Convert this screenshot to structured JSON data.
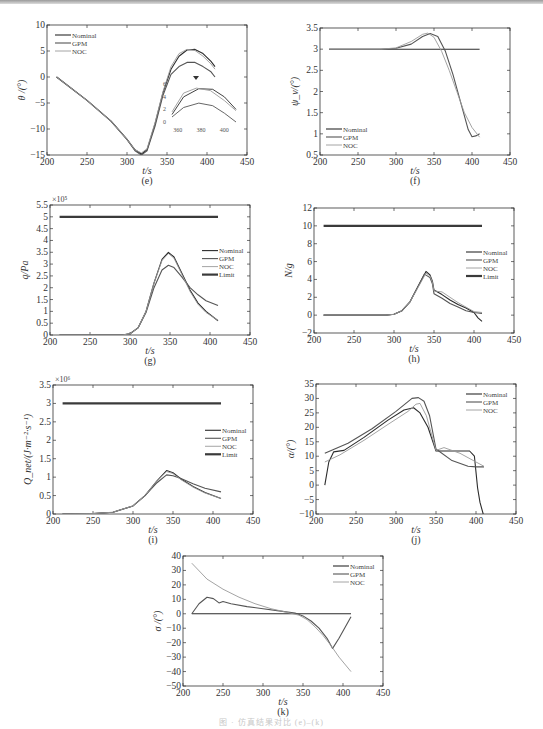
{
  "caption": "图 · 仿真结果对比 (e)–(k)",
  "colors": {
    "Nominal": "#2b2b2b",
    "GPM": "#555555",
    "NOC": "#9a9a9a",
    "Limit": "#3a3a3a"
  },
  "chart_data": [
    {
      "id": "e",
      "type": "line",
      "panel_label": "(e)",
      "xlabel": "t/s",
      "ylabel": "θ /(°)",
      "xlim": [
        200,
        450
      ],
      "ylim": [
        -15,
        10
      ],
      "xticks": [
        200,
        250,
        300,
        350,
        400,
        450
      ],
      "yticks": [
        -15,
        -10,
        -5,
        0,
        5,
        10
      ],
      "box": [
        47,
        25,
        247,
        155
      ],
      "legend": [
        "Nominal",
        "GPM",
        "NOC"
      ],
      "legend_pos": "upper-left",
      "series": [
        {
          "name": "Nominal",
          "x": [
            212,
            250,
            280,
            300,
            310,
            318,
            325,
            335,
            345,
            355,
            365,
            375,
            385,
            395,
            405,
            410
          ],
          "y": [
            0,
            -4.5,
            -8.5,
            -12,
            -14,
            -14.8,
            -14,
            -9,
            -3,
            1.5,
            4,
            5.2,
            5.3,
            4.5,
            3,
            2
          ]
        },
        {
          "name": "GPM",
          "x": [
            212,
            250,
            280,
            300,
            310,
            318,
            325,
            335,
            345,
            355,
            365,
            375,
            385,
            395,
            405,
            410
          ],
          "y": [
            0,
            -4.5,
            -8.5,
            -12,
            -14.2,
            -15,
            -14.2,
            -9.5,
            -3.5,
            0.5,
            2,
            2.8,
            2.8,
            2,
            1,
            0
          ]
        },
        {
          "name": "NOC",
          "x": [
            212,
            250,
            280,
            300,
            310,
            318,
            325,
            335,
            345,
            355,
            365,
            375,
            385,
            395,
            405,
            410
          ],
          "y": [
            0,
            -4.5,
            -8.5,
            -12,
            -14,
            -14.6,
            -13.8,
            -8.8,
            -2.8,
            2,
            4.5,
            5.3,
            5.1,
            4,
            2.5,
            1.5
          ]
        }
      ],
      "inset": {
        "xticks": [
          360,
          380,
          400
        ],
        "yticks": [
          0,
          2,
          4,
          6
        ],
        "note": "zoom of 355–410 s region"
      }
    },
    {
      "id": "f",
      "type": "line",
      "panel_label": "(f)",
      "xlabel": "t/s",
      "ylabel": "ψ_v/(°)",
      "xlim": [
        200,
        450
      ],
      "ylim": [
        0.5,
        3.5
      ],
      "xticks": [
        200,
        250,
        300,
        350,
        400,
        450
      ],
      "yticks": [
        0.5,
        1,
        1.5,
        2,
        2.5,
        3,
        3.5
      ],
      "box": [
        320,
        28,
        510,
        155
      ],
      "legend": [
        "Nominal",
        "GPM",
        "NOC"
      ],
      "legend_pos": "lower-left",
      "series": [
        {
          "name": "Nominal",
          "x": [
            212,
            410
          ],
          "y": [
            3,
            3
          ]
        },
        {
          "name": "GPM",
          "x": [
            212,
            280,
            300,
            320,
            335,
            345,
            355,
            365,
            375,
            385,
            395,
            400,
            405,
            410
          ],
          "y": [
            3,
            3,
            3.02,
            3.12,
            3.3,
            3.37,
            3.3,
            2.95,
            2.4,
            1.75,
            1.1,
            0.93,
            0.95,
            1.0
          ]
        },
        {
          "name": "NOC",
          "x": [
            212,
            280,
            300,
            320,
            335,
            342,
            350,
            360,
            370,
            380,
            390,
            400,
            410
          ],
          "y": [
            3,
            3,
            3.03,
            3.18,
            3.35,
            3.38,
            3.28,
            2.95,
            2.5,
            2.0,
            1.5,
            1.15,
            0.92
          ]
        }
      ]
    },
    {
      "id": "g",
      "type": "line",
      "panel_label": "(g)",
      "xlabel": "t/s",
      "ylabel": "q/Pa",
      "multiplier": "×10⁵",
      "xlim": [
        200,
        450
      ],
      "ylim": [
        0,
        5.5
      ],
      "xticks": [
        200,
        250,
        300,
        350,
        400,
        450
      ],
      "yticks": [
        0,
        0.5,
        1,
        1.5,
        2,
        2.5,
        3,
        3.5,
        4,
        4.5,
        5,
        5.5
      ],
      "box": [
        50,
        205,
        250,
        335
      ],
      "legend": [
        "Nominal",
        "GPM",
        "NOC",
        "Limit"
      ],
      "legend_pos": "right",
      "series": [
        {
          "name": "Nominal",
          "x": [
            212,
            290,
            300,
            310,
            320,
            330,
            340,
            348,
            355,
            365,
            375,
            385,
            395,
            410
          ],
          "y": [
            0,
            0,
            0.05,
            0.3,
            1.0,
            2.2,
            3.2,
            3.5,
            3.3,
            2.6,
            1.9,
            1.35,
            1.0,
            0.6
          ]
        },
        {
          "name": "GPM",
          "x": [
            212,
            290,
            300,
            310,
            320,
            330,
            340,
            348,
            355,
            365,
            375,
            385,
            395,
            410
          ],
          "y": [
            0,
            0,
            0.05,
            0.3,
            0.95,
            2.0,
            2.75,
            2.95,
            2.85,
            2.45,
            2.0,
            1.7,
            1.45,
            1.25
          ]
        },
        {
          "name": "NOC",
          "x": [
            212,
            290,
            300,
            310,
            320,
            330,
            340,
            348,
            355,
            365,
            375,
            385,
            395,
            410
          ],
          "y": [
            0,
            0,
            0.05,
            0.3,
            1.0,
            2.2,
            3.15,
            3.45,
            3.25,
            2.55,
            1.85,
            1.3,
            0.95,
            0.62
          ]
        },
        {
          "name": "Limit",
          "x": [
            212,
            410
          ],
          "y": [
            5,
            5
          ]
        }
      ]
    },
    {
      "id": "h",
      "type": "line",
      "panel_label": "(h)",
      "xlabel": "t/s",
      "ylabel": "N/g",
      "xlim": [
        200,
        450
      ],
      "ylim": [
        -2,
        12
      ],
      "xticks": [
        200,
        250,
        300,
        350,
        400,
        450
      ],
      "yticks": [
        -2,
        0,
        2,
        4,
        6,
        8,
        10,
        12
      ],
      "box": [
        314,
        208,
        514,
        333
      ],
      "legend": [
        "Nominal",
        "GPM",
        "NOC",
        "Limit"
      ],
      "legend_pos": "right",
      "series": [
        {
          "name": "Nominal",
          "x": [
            212,
            290,
            300,
            310,
            320,
            330,
            340,
            345,
            348,
            350,
            360,
            370,
            380,
            390,
            400,
            405,
            410
          ],
          "y": [
            0,
            0,
            0.1,
            0.5,
            1.5,
            3.2,
            4.9,
            4.5,
            3.8,
            2.8,
            2.3,
            1.7,
            1.2,
            0.8,
            0.3,
            -0.3,
            -0.7
          ]
        },
        {
          "name": "GPM",
          "x": [
            212,
            290,
            300,
            310,
            320,
            330,
            338,
            345,
            348,
            350,
            360,
            370,
            380,
            390,
            400,
            410
          ],
          "y": [
            0,
            0,
            0.1,
            0.5,
            1.5,
            3.2,
            4.6,
            4.2,
            3.5,
            2.4,
            1.9,
            1.3,
            0.9,
            0.5,
            0.3,
            0.2
          ]
        },
        {
          "name": "NOC",
          "x": [
            212,
            290,
            300,
            310,
            320,
            330,
            340,
            345,
            348,
            350,
            360,
            370,
            380,
            390,
            400,
            410
          ],
          "y": [
            0,
            0,
            0.1,
            0.5,
            1.5,
            3.1,
            4.7,
            4.4,
            3.7,
            2.7,
            2.6,
            2.0,
            1.4,
            0.9,
            0.4,
            0.3
          ]
        },
        {
          "name": "Limit",
          "x": [
            212,
            410
          ],
          "y": [
            10,
            10
          ]
        }
      ]
    },
    {
      "id": "i",
      "type": "line",
      "panel_label": "(i)",
      "xlabel": "t/s",
      "ylabel": "Q_net/(J·m⁻²·s⁻¹)",
      "multiplier": "×10⁶",
      "xlim": [
        200,
        450
      ],
      "ylim": [
        0,
        3.5
      ],
      "xticks": [
        200,
        250,
        300,
        350,
        400,
        450
      ],
      "yticks": [
        0,
        0.5,
        1,
        1.5,
        2,
        2.5,
        3,
        3.5
      ],
      "box": [
        53,
        385,
        253,
        514
      ],
      "legend": [
        "Nominal",
        "GPM",
        "NOC",
        "Limit"
      ],
      "legend_pos": "right",
      "series": [
        {
          "name": "Nominal",
          "x": [
            212,
            250,
            275,
            300,
            315,
            330,
            342,
            350,
            360,
            375,
            390,
            410
          ],
          "y": [
            0,
            0.01,
            0.05,
            0.22,
            0.5,
            0.9,
            1.18,
            1.12,
            0.95,
            0.75,
            0.58,
            0.42
          ]
        },
        {
          "name": "GPM",
          "x": [
            212,
            250,
            275,
            300,
            315,
            330,
            342,
            350,
            360,
            375,
            390,
            410
          ],
          "y": [
            0,
            0.01,
            0.05,
            0.22,
            0.5,
            0.85,
            1.06,
            1.04,
            0.96,
            0.82,
            0.7,
            0.6
          ]
        },
        {
          "name": "NOC",
          "x": [
            212,
            250,
            275,
            300,
            315,
            330,
            342,
            350,
            360,
            375,
            390,
            410
          ],
          "y": [
            0,
            0.01,
            0.05,
            0.22,
            0.5,
            0.9,
            1.15,
            1.1,
            0.93,
            0.73,
            0.57,
            0.42
          ]
        },
        {
          "name": "Limit",
          "x": [
            212,
            410
          ],
          "y": [
            3,
            3
          ]
        }
      ]
    },
    {
      "id": "j",
      "type": "line",
      "panel_label": "(j)",
      "xlabel": "t/s",
      "ylabel": "α/(°)",
      "xlim": [
        200,
        450
      ],
      "ylim": [
        -10,
        35
      ],
      "xticks": [
        200,
        250,
        300,
        350,
        400,
        450
      ],
      "yticks": [
        -10,
        -5,
        0,
        5,
        10,
        15,
        20,
        25,
        30,
        35
      ],
      "box": [
        316,
        384,
        516,
        514
      ],
      "legend": [
        "Nominal",
        "GPM",
        "NOC"
      ],
      "legend_pos": "upper-right",
      "series": [
        {
          "name": "Nominal",
          "x": [
            211,
            216,
            222,
            235,
            260,
            290,
            310,
            322,
            330,
            340,
            350,
            360,
            380,
            392,
            398,
            402,
            405,
            409
          ],
          "y": [
            0,
            8,
            11.5,
            12,
            16.5,
            22.5,
            26,
            26.8,
            25,
            20,
            11.8,
            11.8,
            11.8,
            11.8,
            10,
            -1,
            -6,
            -10
          ]
        },
        {
          "name": "GPM",
          "x": [
            211,
            240,
            270,
            300,
            320,
            328,
            335,
            342,
            350,
            370,
            390,
            400,
            410
          ],
          "y": [
            11,
            14.5,
            19.5,
            25.5,
            30,
            30.3,
            29,
            24,
            12.5,
            8.5,
            6.5,
            6.3,
            6.3
          ]
        },
        {
          "name": "NOC",
          "x": [
            211,
            230,
            260,
            290,
            315,
            325,
            330,
            338,
            350,
            360,
            380,
            400,
            410
          ],
          "y": [
            8,
            10.5,
            15.5,
            21,
            25.5,
            28,
            28.3,
            24,
            12,
            13,
            11,
            8,
            6.5
          ]
        }
      ]
    },
    {
      "id": "k",
      "type": "line",
      "panel_label": "(k)",
      "xlabel": "t/s",
      "ylabel": "σ /(°)",
      "xlim": [
        200,
        450
      ],
      "ylim": [
        -50,
        40
      ],
      "xticks": [
        200,
        250,
        300,
        350,
        400,
        450
      ],
      "yticks": [
        -50,
        -40,
        -30,
        -20,
        -10,
        0,
        10,
        20,
        30,
        40
      ],
      "box": [
        183,
        556,
        383,
        686
      ],
      "legend": [
        "Nominal",
        "GPM",
        "NOC"
      ],
      "legend_pos": "upper-right",
      "series": [
        {
          "name": "Nominal",
          "x": [
            211,
            410
          ],
          "y": [
            0,
            0
          ]
        },
        {
          "name": "GPM",
          "x": [
            211,
            220,
            230,
            238,
            245,
            250,
            260,
            280,
            300,
            320,
            340,
            350,
            360,
            370,
            380,
            387,
            395,
            410
          ],
          "y": [
            0,
            7,
            11.5,
            10.5,
            7.5,
            8.5,
            7,
            5,
            3.5,
            2,
            0.5,
            -1.5,
            -5,
            -10,
            -17,
            -24,
            -17,
            -2
          ]
        },
        {
          "name": "NOC",
          "x": [
            211,
            230,
            250,
            270,
            290,
            310,
            330,
            345,
            355,
            365,
            375,
            385,
            395,
            410
          ],
          "y": [
            35,
            24,
            17,
            11.5,
            7,
            3.5,
            1,
            -1,
            -4,
            -9,
            -15,
            -22,
            -30,
            -40
          ]
        }
      ]
    }
  ]
}
